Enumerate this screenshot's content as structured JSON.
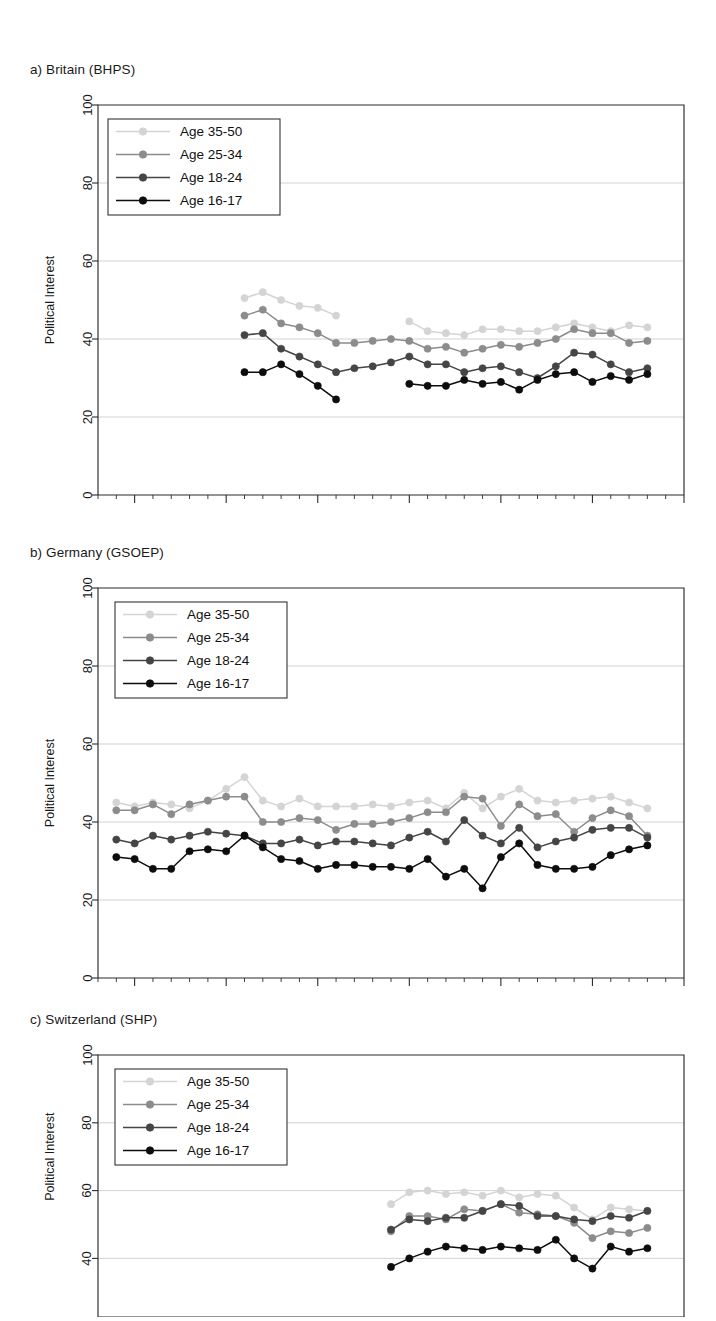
{
  "figure": {
    "y_axis_title": "Political Interest",
    "y_ticks": [
      "0",
      "20",
      "40",
      "60",
      "80",
      "100"
    ],
    "x_ticks": [
      "1985",
      "1990",
      "1995",
      "2000",
      "2005",
      "2010",
      "2015"
    ],
    "legend_labels": [
      "Age 35-50",
      "Age 25-34",
      "Age 18-24",
      "Age 16-17"
    ],
    "series_colors": [
      "#d4d4d4",
      "#8c8c8c",
      "#454545",
      "#0d0d0d"
    ]
  },
  "panels": [
    {
      "id": "a",
      "title": "a) Britain (BHPS)"
    },
    {
      "id": "b",
      "title": "b) Germany (GSOEP)"
    },
    {
      "id": "c",
      "title": "c) Switzerland (SHP)"
    }
  ],
  "chart_data": [
    {
      "type": "line",
      "panel": "a",
      "title": "a) Britain (BHPS)",
      "xlabel": "",
      "ylabel": "Political Interest",
      "ylim": [
        0,
        100
      ],
      "xlim": [
        1983,
        2015
      ],
      "grid": true,
      "legend_position": "top-left",
      "x": [
        1991,
        1992,
        1993,
        1994,
        1995,
        1996,
        1997,
        1998,
        1999,
        2000,
        2001,
        2002,
        2003,
        2004,
        2005,
        2006,
        2007,
        2008,
        2009,
        2010,
        2011,
        2012,
        2013
      ],
      "series": [
        {
          "name": "Age 35-50",
          "color": "#d4d4d4",
          "values": [
            50.5,
            52.0,
            50.0,
            48.5,
            48.0,
            46.0,
            null,
            null,
            null,
            44.5,
            42.0,
            41.5,
            41.0,
            42.5,
            42.5,
            42.0,
            42.0,
            43.0,
            44.0,
            43.0,
            42.0,
            43.5,
            43.0
          ]
        },
        {
          "name": "Age 25-34",
          "color": "#8c8c8c",
          "values": [
            46.0,
            47.5,
            44.0,
            43.0,
            41.5,
            39.0,
            39.0,
            39.5,
            40.0,
            39.5,
            37.5,
            38.0,
            36.5,
            37.5,
            38.5,
            38.0,
            39.0,
            40.0,
            42.5,
            41.5,
            41.5,
            39.0,
            39.5
          ]
        },
        {
          "name": "Age 18-24",
          "color": "#454545",
          "values": [
            41.0,
            41.5,
            37.5,
            35.5,
            33.5,
            31.5,
            32.5,
            33.0,
            34.0,
            35.5,
            33.5,
            33.5,
            31.5,
            32.5,
            33.0,
            31.5,
            30.0,
            33.0,
            36.5,
            36.0,
            33.5,
            31.5,
            32.5
          ]
        },
        {
          "name": "Age 16-17",
          "color": "#0d0d0d",
          "values": [
            31.5,
            31.5,
            33.5,
            31.0,
            28.0,
            24.5,
            null,
            null,
            null,
            28.5,
            28.0,
            28.0,
            29.5,
            28.5,
            29.0,
            27.0,
            29.5,
            31.0,
            31.5,
            29.0,
            30.5,
            29.5,
            31.0
          ]
        }
      ]
    },
    {
      "type": "line",
      "panel": "b",
      "title": "b) Germany (GSOEP)",
      "xlabel": "",
      "ylabel": "Political Interest",
      "ylim": [
        0,
        100
      ],
      "xlim": [
        1983,
        2015
      ],
      "grid": true,
      "legend_position": "top-left",
      "x": [
        1984,
        1985,
        1986,
        1987,
        1988,
        1989,
        1990,
        1991,
        1992,
        1993,
        1994,
        1995,
        1996,
        1997,
        1998,
        1999,
        2000,
        2001,
        2002,
        2003,
        2004,
        2005,
        2006,
        2007,
        2008,
        2009,
        2010,
        2011,
        2012,
        2013
      ],
      "series": [
        {
          "name": "Age 35-50",
          "color": "#d4d4d4",
          "values": [
            45.0,
            44.0,
            45.0,
            44.5,
            43.5,
            45.5,
            48.5,
            51.5,
            45.5,
            44.0,
            46.0,
            44.0,
            44.0,
            44.0,
            44.5,
            44.0,
            45.0,
            45.5,
            43.5,
            47.5,
            43.5,
            46.5,
            48.5,
            45.5,
            45.0,
            45.5,
            46.0,
            46.5,
            45.0,
            43.5
          ]
        },
        {
          "name": "Age 25-34",
          "color": "#8c8c8c",
          "values": [
            43.0,
            43.0,
            44.5,
            42.0,
            44.5,
            45.5,
            46.5,
            46.5,
            40.0,
            40.0,
            41.0,
            40.5,
            38.0,
            39.5,
            39.5,
            40.0,
            41.0,
            42.5,
            42.5,
            46.5,
            46.0,
            39.0,
            44.5,
            41.5,
            42.0,
            37.5,
            41.0,
            43.0,
            41.5,
            36.5
          ]
        },
        {
          "name": "Age 18-24",
          "color": "#454545",
          "values": [
            35.5,
            34.5,
            36.5,
            35.5,
            36.5,
            37.5,
            37.0,
            36.5,
            34.5,
            34.5,
            35.5,
            34.0,
            35.0,
            35.0,
            34.5,
            34.0,
            36.0,
            37.5,
            35.0,
            40.5,
            36.5,
            34.5,
            38.5,
            33.5,
            35.0,
            36.0,
            38.0,
            38.5,
            38.5,
            36.0
          ]
        },
        {
          "name": "Age 16-17",
          "color": "#0d0d0d",
          "values": [
            31.0,
            30.5,
            28.0,
            28.0,
            32.5,
            33.0,
            32.5,
            36.5,
            33.5,
            30.5,
            30.0,
            28.0,
            29.0,
            29.0,
            28.5,
            28.5,
            28.0,
            30.5,
            26.0,
            28.0,
            23.0,
            31.0,
            34.5,
            29.0,
            28.0,
            28.0,
            28.5,
            31.5,
            33.0,
            34.0
          ]
        }
      ]
    },
    {
      "type": "line",
      "panel": "c",
      "title": "c) Switzerland (SHP)",
      "xlabel": "",
      "ylabel": "Political Interest",
      "ylim": [
        40,
        100
      ],
      "ylim_note": "panel cropped at bottom of screenshot; lowest visible tick is 40",
      "xlim": [
        1983,
        2015
      ],
      "grid": true,
      "legend_position": "top-left",
      "x": [
        1999,
        2000,
        2001,
        2002,
        2003,
        2004,
        2005,
        2006,
        2007,
        2008,
        2009,
        2010,
        2011,
        2012,
        2013
      ],
      "series": [
        {
          "name": "Age 35-50",
          "color": "#d4d4d4",
          "values": [
            56.0,
            59.5,
            60.0,
            59.0,
            59.5,
            58.5,
            60.0,
            58.0,
            59.0,
            58.5,
            55.0,
            51.5,
            55.0,
            54.5,
            54.0
          ]
        },
        {
          "name": "Age 25-34",
          "color": "#8c8c8c",
          "values": [
            48.0,
            52.5,
            52.5,
            51.5,
            54.5,
            54.0,
            56.0,
            53.5,
            53.0,
            52.5,
            50.5,
            46.0,
            48.0,
            47.5,
            49.0
          ]
        },
        {
          "name": "Age 18-24",
          "color": "#454545",
          "values": [
            48.5,
            51.5,
            51.0,
            52.0,
            52.0,
            54.0,
            56.0,
            55.5,
            52.5,
            52.5,
            51.5,
            51.0,
            52.5,
            52.0,
            54.0
          ]
        },
        {
          "name": "Age 16-17",
          "color": "#0d0d0d",
          "values": [
            37.5,
            40.0,
            42.0,
            43.5,
            43.0,
            42.5,
            43.5,
            43.0,
            42.5,
            45.5,
            40.0,
            37.0,
            43.5,
            42.0,
            43.0
          ]
        }
      ]
    }
  ]
}
